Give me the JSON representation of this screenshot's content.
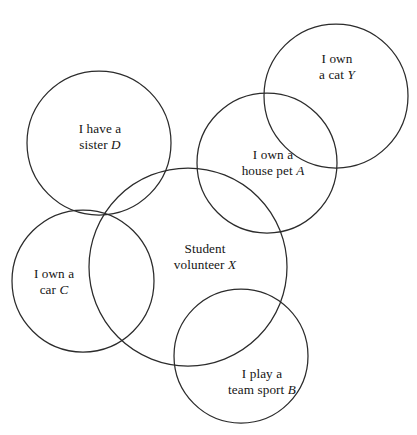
{
  "diagram": {
    "type": "venn-diagram",
    "stroke_color": "#2b2b2b",
    "background_color": "#ffffff",
    "text_color": "#151515",
    "sets": [
      {
        "id": "cat-y",
        "symbol": "Y",
        "line1": "I own",
        "line2_text": "a cat ",
        "cx": 336,
        "cy": 96,
        "r": 72,
        "label_x": 337,
        "label_y": 67
      },
      {
        "id": "house-pet-a",
        "symbol": "A",
        "line1": "I own a",
        "line2_text": "house pet ",
        "cx": 267,
        "cy": 163,
        "r": 70,
        "label_x": 273,
        "label_y": 163
      },
      {
        "id": "sister-d",
        "symbol": "D",
        "line1": "I have a",
        "line2_text": "sister ",
        "cx": 99,
        "cy": 143,
        "r": 72,
        "label_x": 100,
        "label_y": 137
      },
      {
        "id": "car-c",
        "symbol": "C",
        "line1": "I own a",
        "line2_text": "car ",
        "cx": 83,
        "cy": 281,
        "r": 71,
        "label_x": 54,
        "label_y": 282
      },
      {
        "id": "student-volunteer-x",
        "symbol": "X",
        "line1": "Student",
        "line2_text": "volunteer ",
        "cx": 188,
        "cy": 267,
        "r": 99,
        "label_x": 205,
        "label_y": 257
      },
      {
        "id": "team-sport-b",
        "symbol": "B",
        "line1": "I play a",
        "line2_text": "team sport ",
        "cx": 241,
        "cy": 356,
        "r": 67,
        "label_x": 262,
        "label_y": 382
      }
    ]
  }
}
